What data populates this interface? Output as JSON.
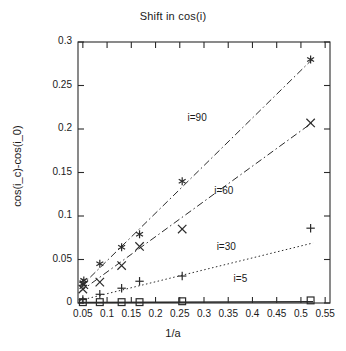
{
  "chart_data": {
    "type": "scatter",
    "title": "Shift in cos(i)",
    "xlabel": "1/a",
    "ylabel": "cos(i_c)-cos(i_0)",
    "xlim": [
      0.04,
      0.56
    ],
    "ylim": [
      0,
      0.3
    ],
    "xticks": [
      "0.05",
      "0.1",
      "0.15",
      "0.2",
      "0.25",
      "0.3",
      "0.35",
      "0.4",
      "0.45",
      "0.5",
      "0.55"
    ],
    "xtick_values": [
      0.05,
      0.1,
      0.15,
      0.2,
      0.25,
      0.3,
      0.35,
      0.4,
      0.45,
      0.5,
      0.55
    ],
    "yticks": [
      "0",
      "0.05",
      "0.1",
      "0.15",
      "0.2",
      "0.25",
      "0.3"
    ],
    "ytick_values": [
      0,
      0.05,
      0.1,
      0.15,
      0.2,
      0.25,
      0.3
    ],
    "grid": false,
    "legend_position": "inline-annotations",
    "series": [
      {
        "name": "i=90",
        "marker": "star",
        "linestyle": "dashdot",
        "color": "#2b2b2b",
        "annotation": "i=90",
        "annotation_x": 0.295,
        "annotation_y": 0.212,
        "x": [
          0.05,
          0.052,
          0.085,
          0.13,
          0.167,
          0.255,
          0.52
        ],
        "y": [
          0.022,
          0.026,
          0.045,
          0.064,
          0.079,
          0.14,
          0.28
        ],
        "fit_x": [
          0.044,
          0.525
        ],
        "fit_y": [
          0.018,
          0.281
        ]
      },
      {
        "name": "i=60",
        "marker": "cross",
        "linestyle": "dashdot",
        "color": "#2b2b2b",
        "annotation": "i=60",
        "annotation_x": 0.35,
        "annotation_y": 0.128,
        "x": [
          0.05,
          0.052,
          0.085,
          0.13,
          0.167,
          0.255,
          0.52
        ],
        "y": [
          0.016,
          0.021,
          0.024,
          0.043,
          0.065,
          0.085,
          0.207
        ],
        "fit_x": [
          0.044,
          0.525
        ],
        "fit_y": [
          0.013,
          0.208
        ]
      },
      {
        "name": "i=30",
        "marker": "plus",
        "linestyle": "dotted",
        "color": "#2b2b2b",
        "annotation": "i=30",
        "annotation_x": 0.355,
        "annotation_y": 0.063,
        "x": [
          0.05,
          0.085,
          0.13,
          0.167,
          0.255,
          0.52
        ],
        "y": [
          0.004,
          0.01,
          0.017,
          0.025,
          0.031,
          0.086
        ],
        "fit_x": [
          0.044,
          0.525
        ],
        "fit_y": [
          0.003,
          0.069
        ]
      },
      {
        "name": "i=5",
        "marker": "square",
        "linestyle": "solid",
        "color": "#2b2b2b",
        "annotation": "i=5",
        "annotation_x": 0.39,
        "annotation_y": 0.027,
        "x": [
          0.05,
          0.085,
          0.13,
          0.167,
          0.255,
          0.52
        ],
        "y": [
          0.001,
          0.001,
          0.001,
          0.001,
          0.002,
          0.003
        ],
        "fit_x": [
          0.044,
          0.525
        ],
        "fit_y": [
          0.0005,
          0.0015
        ]
      }
    ]
  }
}
